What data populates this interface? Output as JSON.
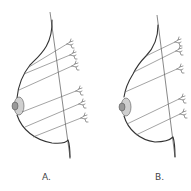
{
  "diagram": {
    "type": "anatomical-illustration",
    "panels": [
      {
        "id": "A",
        "label": "A.",
        "lobule_count": 6
      },
      {
        "id": "B",
        "label": "B.",
        "lobule_count": 5
      }
    ],
    "colors": {
      "outline": "#333333",
      "ducts": "#666666",
      "areola": "#cfcfcf",
      "nipple": "#999999",
      "background": "#ffffff"
    }
  }
}
